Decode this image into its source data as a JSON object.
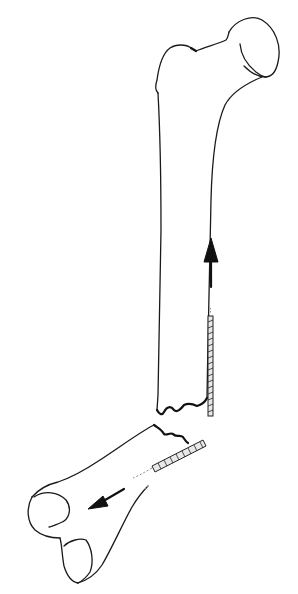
{
  "figure": {
    "stroke_color": "#1a1a1a",
    "background": "#ffffff",
    "elements": [
      {
        "name": "proximal-femur-fragment",
        "description": "Femoral head, neck, greater trochanter and proximal shaft"
      },
      {
        "name": "distal-femur-fragment",
        "description": "Distal shaft and condyles, displaced and angulated"
      },
      {
        "name": "proximal-pin",
        "description": "Threaded pin lateral to proximal shaft"
      },
      {
        "name": "distal-pin",
        "description": "Threaded pin in distal fragment"
      },
      {
        "name": "arrow-up",
        "description": "Arrow pointing upward (proximal direction)"
      },
      {
        "name": "arrow-down-left",
        "description": "Arrow pointing down-left (distal direction)"
      }
    ]
  }
}
